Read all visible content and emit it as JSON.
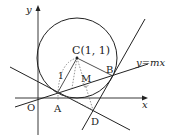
{
  "diagram": {
    "axes": {
      "x_label": "x",
      "y_label": "y",
      "origin_label": "O"
    },
    "circle": {
      "center_label": "C(1, 1)",
      "radius_label": "1"
    },
    "points": {
      "A": "A",
      "B": "B",
      "D": "D",
      "M": "M"
    },
    "line_label": "y=mx",
    "colors": {
      "stroke": "#222222",
      "dotted": "#666666"
    }
  }
}
